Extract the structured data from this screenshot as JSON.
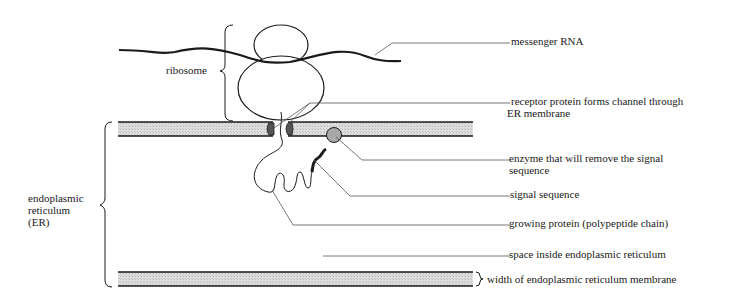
{
  "diagram": {
    "labels": {
      "ribosome": "ribosome",
      "er": [
        "endoplasmic",
        "reticulum",
        "(ER)"
      ],
      "messenger_rna": "messenger RNA",
      "receptor_protein": [
        "receptor protein forms channel through",
        "ER membrane"
      ],
      "enzyme": [
        "enzyme that will remove the signal",
        "sequence"
      ],
      "signal_sequence": "signal sequence",
      "growing_protein": "growing protein (polypeptide chain)",
      "space_inside": "space inside endoplasmic reticulum",
      "membrane_width": "width of endoplasmic reticulum membrane"
    },
    "colors": {
      "ink": "#1a1a1a",
      "leader": "#555555",
      "membrane_fill": "#d9d9d9",
      "enzyme_fill": "#a8a8a8",
      "receptor_fill": "#555555"
    }
  }
}
